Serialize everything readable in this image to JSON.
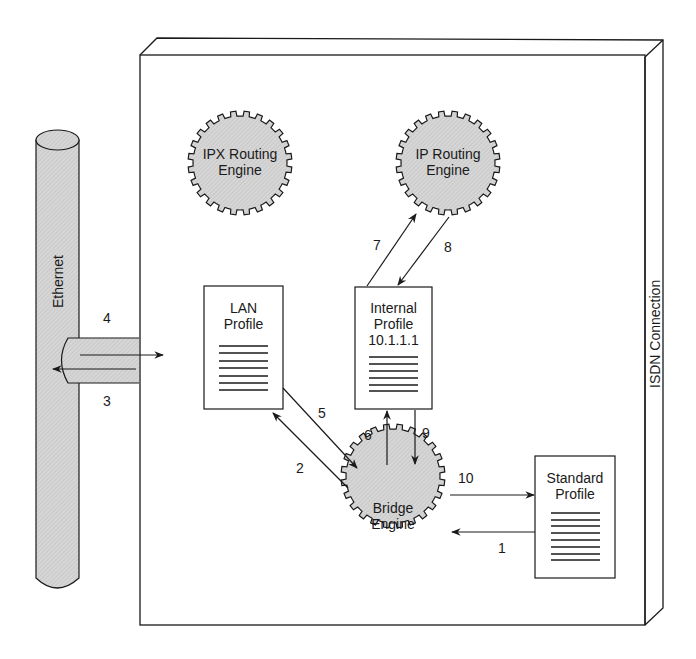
{
  "diagram": {
    "container": {
      "label": "ISDN Connection"
    },
    "ethernet": {
      "label": "Ethernet"
    },
    "engines": [
      {
        "id": "ipx",
        "line1": "IPX Routing",
        "line2": "Engine"
      },
      {
        "id": "ip",
        "line1": "IP Routing",
        "line2": "Engine"
      },
      {
        "id": "bridge",
        "line1": "Bridge",
        "line2": "Engine"
      }
    ],
    "profiles": [
      {
        "id": "lan",
        "line1": "LAN",
        "line2": "Profile",
        "line3": ""
      },
      {
        "id": "internal",
        "line1": "Internal",
        "line2": "Profile",
        "line3": "10.1.1.1"
      },
      {
        "id": "standard",
        "line1": "Standard",
        "line2": "Profile",
        "line3": ""
      }
    ],
    "steps": [
      {
        "n": "1",
        "from": "Standard Profile",
        "to": "Bridge Engine"
      },
      {
        "n": "2",
        "from": "Bridge Engine",
        "to": "LAN Profile"
      },
      {
        "n": "3",
        "from": "ISDN Connection",
        "to": "Ethernet"
      },
      {
        "n": "4",
        "from": "Ethernet",
        "to": "ISDN Connection"
      },
      {
        "n": "5",
        "from": "LAN Profile",
        "to": "Bridge Engine"
      },
      {
        "n": "6",
        "from": "Bridge Engine",
        "to": "Internal Profile"
      },
      {
        "n": "7",
        "from": "Internal Profile",
        "to": "IP Routing Engine"
      },
      {
        "n": "8",
        "from": "IP Routing Engine",
        "to": "Internal Profile"
      },
      {
        "n": "9",
        "from": "Internal Profile",
        "to": "Bridge Engine"
      },
      {
        "n": "10",
        "from": "Bridge Engine",
        "to": "Standard Profile"
      }
    ],
    "colors": {
      "line": "#1a1a1a",
      "fill_gray": "#d4d4d4",
      "background": "#ffffff"
    }
  }
}
